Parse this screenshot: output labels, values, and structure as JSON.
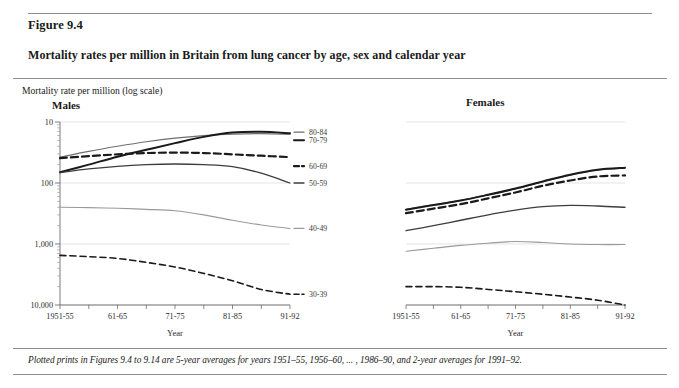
{
  "figure": {
    "number": "Figure 9.4",
    "title": "Mortality rates per million in Britain from lung cancer by age, sex and calendar year",
    "axis_caption": "Mortality rate per million (log scale)",
    "footnote": "Plotted prints in Figures 9.4 to 9.14 are 5-year averages for years 1951–55, 1956–60, ... , 1986–90, and 2-year averages for 1991–92."
  },
  "panels": {
    "males_label": "Males",
    "females_label": "Females"
  },
  "axes": {
    "x_title": "Year",
    "x_ticklabels": [
      "1951-55",
      "61-65",
      "71-75",
      "81-85",
      "91-92"
    ],
    "y_ticklabels": [
      "10,000",
      "1,000",
      "100",
      "10"
    ]
  },
  "chart_data": {
    "type": "line",
    "title": "Mortality rates per million in Britain from lung cancer by age, sex and calendar year",
    "xlabel": "Year",
    "ylabel": "Mortality rate per million (log scale)",
    "yscale": "log",
    "ylim": [
      10,
      10000
    ],
    "yticks": [
      10,
      100,
      1000,
      10000
    ],
    "ytick_labels": [
      "10",
      "100",
      "1,000",
      "10,000"
    ],
    "grid": "horizontal-major",
    "legend_position": "right-of-males-panel",
    "x": [
      "1951-55",
      "1956-60",
      "1961-65",
      "1966-70",
      "1971-75",
      "1976-80",
      "1981-85",
      "1986-90",
      "1991-92"
    ],
    "x_tick_positions": [
      "1951-55",
      "61-65",
      "71-75",
      "81-85",
      "91-92"
    ],
    "panels": [
      {
        "name": "Males",
        "series": [
          {
            "name": "80-84",
            "style": "solid-thin-grey",
            "color": "#6e6e6e",
            "width": 1.2,
            "dash": "none",
            "values": [
              2650,
              3300,
              4000,
              4750,
              5450,
              6000,
              6350,
              6450,
              6300
            ]
          },
          {
            "name": "70-79",
            "style": "solid-thick-black",
            "color": "#1a1a1a",
            "width": 2.0,
            "dash": "none",
            "values": [
              1500,
              2000,
              2700,
              3500,
              4500,
              5700,
              6700,
              6900,
              6550
            ]
          },
          {
            "name": "60-69",
            "style": "dashed-thick-black",
            "color": "#1a1a1a",
            "width": 2.2,
            "dash": "7,4",
            "values": [
              2550,
              2750,
              2950,
              3100,
              3150,
              3100,
              2950,
              2800,
              2650
            ]
          },
          {
            "name": "50-59",
            "style": "solid-medium-dark",
            "color": "#3d3d3d",
            "width": 1.3,
            "dash": "none",
            "values": [
              1480,
              1700,
              1880,
              2000,
              2050,
              2000,
              1850,
              1450,
              1000
            ]
          },
          {
            "name": "40-49",
            "style": "solid-thin-light",
            "color": "#9a9a9a",
            "width": 1.1,
            "dash": "none",
            "values": [
              400,
              395,
              385,
              370,
              350,
              300,
              245,
              205,
              180
            ]
          },
          {
            "name": "30-39",
            "style": "dashed-thin-black",
            "color": "#1a1a1a",
            "width": 1.6,
            "dash": "6,4",
            "values": [
              65,
              62,
              58,
              50,
              42,
              33,
              25,
              18,
              15
            ]
          }
        ]
      },
      {
        "name": "Females",
        "series": [
          {
            "name": "80-84",
            "style": "solid-thin-grey",
            "color": "#6e6e6e",
            "width": 1.2,
            "dash": "none",
            "values": [
              370,
              440,
              520,
              640,
              800,
              1050,
              1350,
              1620,
              1750
            ]
          },
          {
            "name": "70-79",
            "style": "solid-thick-black",
            "color": "#1a1a1a",
            "width": 2.0,
            "dash": "none",
            "values": [
              365,
              435,
              515,
              640,
              810,
              1060,
              1370,
              1650,
              1780
            ]
          },
          {
            "name": "60-69",
            "style": "dashed-thick-black",
            "color": "#1a1a1a",
            "width": 2.2,
            "dash": "7,4",
            "values": [
              320,
              380,
              450,
              560,
              700,
              900,
              1100,
              1280,
              1330
            ]
          },
          {
            "name": "50-59",
            "style": "solid-medium-dark",
            "color": "#3d3d3d",
            "width": 1.3,
            "dash": "none",
            "values": [
              165,
              200,
              245,
              300,
              360,
              410,
              430,
              420,
              400
            ]
          },
          {
            "name": "40-49",
            "style": "solid-thin-light",
            "color": "#9a9a9a",
            "width": 1.1,
            "dash": "none",
            "values": [
              76,
              85,
              95,
              103,
              110,
              106,
              100,
              98,
              98
            ]
          },
          {
            "name": "30-39",
            "style": "dashed-thin-black",
            "color": "#1a1a1a",
            "width": 1.6,
            "dash": "6,4",
            "values": [
              20,
              20,
              19.5,
              18,
              16.5,
              15,
              13.5,
              12,
              10
            ]
          }
        ]
      }
    ],
    "legend_entries": [
      "80-84",
      "70-79",
      "60-69",
      "50-59",
      "40-49",
      "30-39"
    ]
  }
}
